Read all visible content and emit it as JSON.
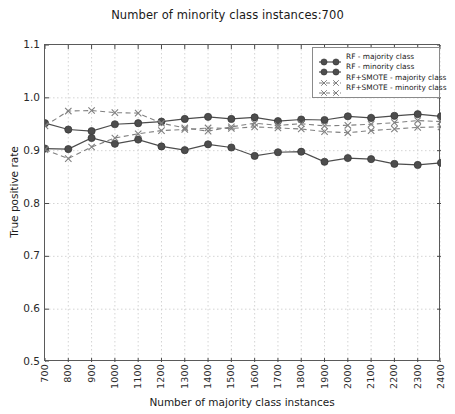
{
  "chart_data": {
    "type": "line",
    "title": "Number of minority class instances:700",
    "xlabel": "Number of majority class instances",
    "ylabel": "True positive rate",
    "x": [
      700,
      800,
      900,
      1000,
      1100,
      1200,
      1300,
      1400,
      1500,
      1600,
      1700,
      1800,
      1900,
      2000,
      2100,
      2200,
      2300,
      2400
    ],
    "xlim": [
      700,
      2400
    ],
    "ylim": [
      0.5,
      1.1
    ],
    "yticks": [
      "0.5",
      "0.6",
      "0.7",
      "0.8",
      "0.9",
      "1.0",
      "1.1"
    ],
    "ytick_values": [
      0.5,
      0.6,
      0.7,
      0.8,
      0.9,
      1.0,
      1.1
    ],
    "xticks": [
      "700",
      "800",
      "900",
      "1000",
      "1100",
      "1200",
      "1300",
      "1400",
      "1500",
      "1600",
      "1700",
      "1800",
      "1900",
      "2000",
      "2100",
      "2200",
      "2300",
      "2400"
    ],
    "grid": true,
    "legend_position": "upper right",
    "series": [
      {
        "name": "RF - majority class",
        "style": "solid",
        "marker": "circle",
        "color": "#4d4d4d",
        "values": [
          0.952,
          0.94,
          0.937,
          0.95,
          0.952,
          0.955,
          0.96,
          0.964,
          0.96,
          0.963,
          0.956,
          0.959,
          0.958,
          0.965,
          0.962,
          0.966,
          0.969,
          0.965
        ]
      },
      {
        "name": "RF - minority class",
        "style": "solid",
        "marker": "circle",
        "color": "#4d4d4d",
        "values": [
          0.904,
          0.903,
          0.924,
          0.913,
          0.921,
          0.908,
          0.901,
          0.912,
          0.906,
          0.89,
          0.897,
          0.898,
          0.879,
          0.886,
          0.884,
          0.875,
          0.873,
          0.877
        ]
      },
      {
        "name": "RF+SMOTE - majority class",
        "style": "dashed",
        "marker": "x",
        "color": "#808080",
        "values": [
          0.947,
          0.975,
          0.976,
          0.972,
          0.971,
          0.952,
          0.943,
          0.937,
          0.945,
          0.952,
          0.948,
          0.951,
          0.947,
          0.948,
          0.95,
          0.953,
          0.957,
          0.955
        ]
      },
      {
        "name": "RF+SMOTE - minority class",
        "style": "dashed",
        "marker": "x",
        "color": "#808080",
        "values": [
          0.902,
          0.885,
          0.907,
          0.924,
          0.932,
          0.938,
          0.94,
          0.943,
          0.942,
          0.945,
          0.943,
          0.941,
          0.936,
          0.934,
          0.938,
          0.941,
          0.944,
          0.945
        ]
      }
    ]
  }
}
